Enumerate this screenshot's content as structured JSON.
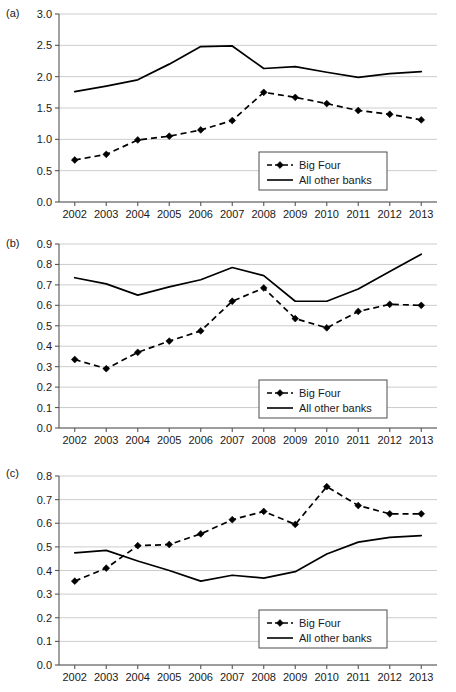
{
  "figure": {
    "panels": [
      {
        "key": "a",
        "label": "(a)",
        "legend": {
          "big_four": "Big Four",
          "all_other": "All other banks"
        }
      },
      {
        "key": "b",
        "label": "(b)",
        "legend": {
          "big_four": "Big Four",
          "all_other": "All other banks"
        }
      },
      {
        "key": "c",
        "label": "(c)",
        "legend": {
          "big_four": "Big Four",
          "all_other": "All other banks"
        }
      }
    ]
  },
  "chart_data": [
    {
      "panel": "a",
      "type": "line",
      "title": "",
      "xlabel": "",
      "ylabel": "",
      "grid": true,
      "legend_position": "lower-right",
      "x": [
        2002,
        2003,
        2004,
        2005,
        2006,
        2007,
        2008,
        2009,
        2010,
        2011,
        2012,
        2013
      ],
      "xtick_labels": [
        "2002",
        "2003",
        "2004",
        "2005",
        "2006",
        "2007",
        "2008",
        "2009",
        "2010",
        "2011",
        "2012",
        "2013"
      ],
      "ylim": [
        0.0,
        3.0
      ],
      "ytick_labels": [
        "0.0",
        "0.5",
        "1.0",
        "1.5",
        "2.0",
        "2.5",
        "3.0"
      ],
      "yticks": [
        0.0,
        0.5,
        1.0,
        1.5,
        2.0,
        2.5,
        3.0
      ],
      "series": [
        {
          "name": "Big Four",
          "style": "dashed",
          "marker": "diamond",
          "values": [
            0.67,
            0.76,
            0.99,
            1.05,
            1.15,
            1.3,
            1.75,
            1.67,
            1.57,
            1.46,
            1.4,
            1.31
          ]
        },
        {
          "name": "All other banks",
          "style": "solid",
          "marker": "none",
          "values": [
            1.76,
            1.85,
            1.95,
            2.2,
            2.48,
            2.49,
            2.13,
            2.16,
            2.07,
            1.99,
            2.05,
            2.08
          ]
        }
      ]
    },
    {
      "panel": "b",
      "type": "line",
      "title": "",
      "xlabel": "",
      "ylabel": "",
      "grid": true,
      "legend_position": "lower-right",
      "x": [
        2002,
        2003,
        2004,
        2005,
        2006,
        2007,
        2008,
        2009,
        2010,
        2011,
        2012,
        2013
      ],
      "xtick_labels": [
        "2002",
        "2003",
        "2004",
        "2005",
        "2006",
        "2007",
        "2008",
        "2009",
        "2010",
        "2011",
        "2012",
        "2013"
      ],
      "ylim": [
        0.0,
        0.9
      ],
      "ytick_labels": [
        "0.0",
        "0.1",
        "0.2",
        "0.3",
        "0.4",
        "0.5",
        "0.6",
        "0.7",
        "0.8",
        "0.9"
      ],
      "yticks": [
        0.0,
        0.1,
        0.2,
        0.3,
        0.4,
        0.5,
        0.6,
        0.7,
        0.8,
        0.9
      ],
      "series": [
        {
          "name": "Big Four",
          "style": "dashed",
          "marker": "diamond",
          "values": [
            0.335,
            0.29,
            0.37,
            0.425,
            0.475,
            0.62,
            0.685,
            0.535,
            0.49,
            0.57,
            0.605,
            0.6
          ]
        },
        {
          "name": "All other banks",
          "style": "solid",
          "marker": "none",
          "values": [
            0.735,
            0.705,
            0.65,
            0.69,
            0.725,
            0.785,
            0.745,
            0.62,
            0.62,
            0.68,
            0.765,
            0.85
          ]
        }
      ]
    },
    {
      "panel": "c",
      "type": "line",
      "title": "",
      "xlabel": "",
      "ylabel": "",
      "grid": true,
      "legend_position": "lower-right",
      "x": [
        2002,
        2003,
        2004,
        2005,
        2006,
        2007,
        2008,
        2009,
        2010,
        2011,
        2012,
        2013
      ],
      "xtick_labels": [
        "2002",
        "2003",
        "2004",
        "2005",
        "2006",
        "2007",
        "2008",
        "2009",
        "2010",
        "2011",
        "2012",
        "2013"
      ],
      "ylim": [
        0.0,
        0.8
      ],
      "ytick_labels": [
        "0.0",
        "0.1",
        "0.2",
        "0.3",
        "0.4",
        "0.5",
        "0.6",
        "0.7",
        "0.8"
      ],
      "yticks": [
        0.0,
        0.1,
        0.2,
        0.3,
        0.4,
        0.5,
        0.6,
        0.7,
        0.8
      ],
      "series": [
        {
          "name": "Big Four",
          "style": "dashed",
          "marker": "diamond",
          "values": [
            0.355,
            0.41,
            0.505,
            0.51,
            0.555,
            0.615,
            0.65,
            0.595,
            0.755,
            0.675,
            0.64,
            0.64
          ]
        },
        {
          "name": "All other banks",
          "style": "solid",
          "marker": "none",
          "values": [
            0.475,
            0.485,
            0.44,
            0.4,
            0.355,
            0.38,
            0.368,
            0.395,
            0.47,
            0.52,
            0.54,
            0.548
          ]
        }
      ]
    }
  ]
}
